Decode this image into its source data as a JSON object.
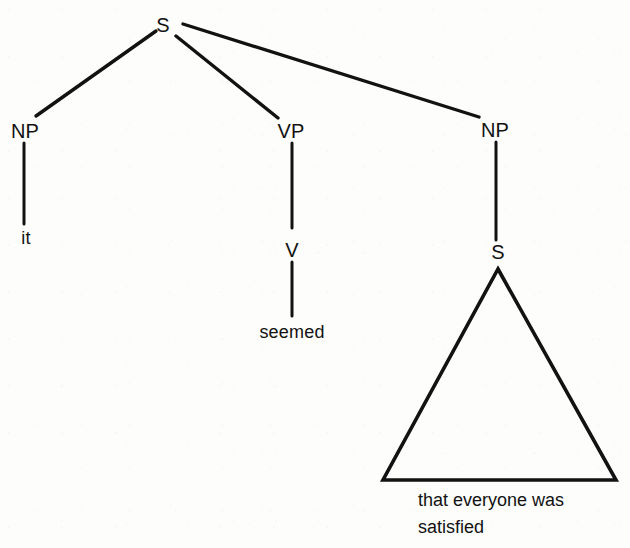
{
  "diagram": {
    "type": "constituency-syntax-tree",
    "ink_color": "#121212",
    "background_color": "#fdfdfc",
    "nodes": {
      "root_s": "S",
      "subject_np": "NP",
      "subject_terminal": "it",
      "vp": "VP",
      "v": "V",
      "v_terminal": "seemed",
      "object_np": "NP",
      "embedded_s": "S"
    },
    "triangle_phrase": "that everyone was\nsatisfied",
    "triangle_phrase_line1": "that everyone was",
    "triangle_phrase_line2": "satisfied",
    "sentence": "it seemed that everyone was satisfied"
  }
}
